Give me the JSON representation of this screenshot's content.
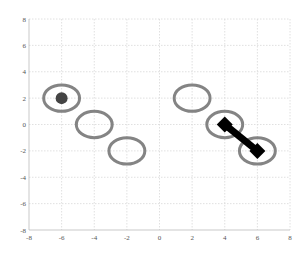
{
  "chart_data": {
    "type": "scatter",
    "title": "",
    "xlabel": "",
    "ylabel": "",
    "xlim": [
      -8,
      8
    ],
    "ylim": [
      -8,
      8
    ],
    "grid": true,
    "x_ticks": [
      -8,
      -6,
      -4,
      -2,
      0,
      2,
      4,
      6,
      8
    ],
    "y_ticks": [
      8,
      6,
      4,
      2,
      0,
      -2,
      -4,
      -6,
      -8
    ],
    "x_tick_labels": [
      "-8",
      "-6",
      "-4",
      "-2",
      "0",
      "2",
      "4",
      "6",
      "8"
    ],
    "y_tick_labels": [
      "8",
      "6",
      "4",
      "2",
      "0",
      "-2",
      "-4",
      "-6",
      "-8"
    ],
    "series": [
      {
        "name": "ellipses",
        "marker": "ellipse-outline",
        "color": "#777777",
        "rx": 1.1,
        "ry": 1.0,
        "points": [
          {
            "x": -6,
            "y": 2
          },
          {
            "x": -4,
            "y": 0
          },
          {
            "x": -2,
            "y": -2
          },
          {
            "x": 2,
            "y": 2
          },
          {
            "x": 4,
            "y": 0
          },
          {
            "x": 6,
            "y": -2
          }
        ]
      },
      {
        "name": "filled-dot",
        "marker": "circle-filled",
        "color": "#444444",
        "points": [
          {
            "x": -6,
            "y": 2
          }
        ]
      },
      {
        "name": "thick-segment",
        "marker": "diamond",
        "color": "#000000",
        "points": [
          {
            "x": 4,
            "y": 0
          },
          {
            "x": 6,
            "y": -2
          }
        ]
      }
    ]
  }
}
